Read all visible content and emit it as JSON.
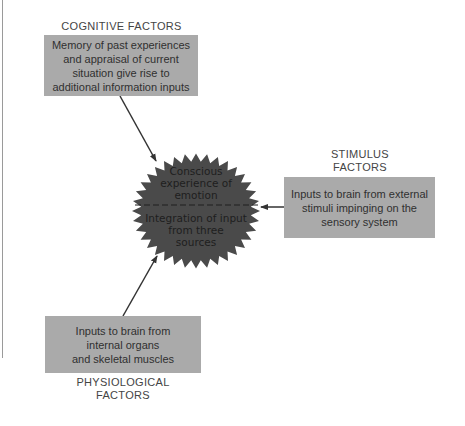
{
  "diagram": {
    "colors": {
      "box_fill": "#aaaaaa",
      "star_fill": "#4a4a4a",
      "arrow": "#333333",
      "text": "#3a3a3a"
    },
    "cognitive": {
      "title": "COGNITIVE FACTORS",
      "lines": [
        "Memory of past experiences",
        "and appraisal of current",
        "situation give rise to",
        "additional information inputs"
      ]
    },
    "stimulus": {
      "title_lines": [
        "STIMULUS",
        "FACTORS"
      ],
      "lines": [
        "Inputs to brain from external",
        "stimuli impinging on the",
        "sensory system"
      ]
    },
    "physiological": {
      "title_lines": [
        "PHYSIOLOGICAL",
        "FACTORS"
      ],
      "lines": [
        "Inputs to brain from",
        "internal organs",
        "and skeletal muscles"
      ]
    },
    "center": {
      "top_lines": [
        "Conscious",
        "experience of",
        "emotion"
      ],
      "bottom_lines": [
        "Integration of input",
        "from three",
        "sources"
      ]
    }
  }
}
